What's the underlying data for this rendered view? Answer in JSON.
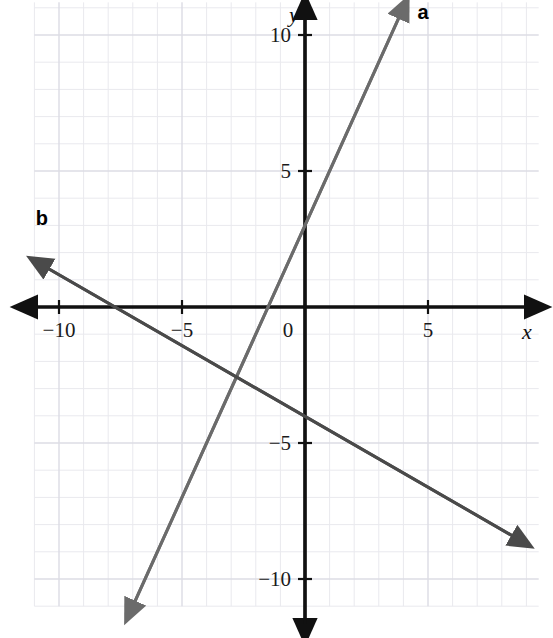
{
  "figure": {
    "background_color": "#ffffff",
    "grid_color": "#e9e9ee",
    "grid_major_color": "#dcdce4",
    "axis_color": "#111111"
  },
  "axes": {
    "x_name": "x",
    "y_name": "y",
    "origin_label": "0",
    "x_ticks": [
      {
        "value": -10,
        "label": "−10"
      },
      {
        "value": -5,
        "label": "−5"
      },
      {
        "value": 5,
        "label": "5"
      }
    ],
    "y_ticks": [
      {
        "value": 10,
        "label": "10"
      },
      {
        "value": 5,
        "label": "5"
      },
      {
        "value": -5,
        "label": "−5"
      },
      {
        "value": -10,
        "label": "−10"
      }
    ]
  },
  "chart_data": {
    "type": "line",
    "title": "",
    "xlabel": "x",
    "ylabel": "y",
    "xlim": [
      -11.0,
      9.5
    ],
    "ylim": [
      -11.0,
      11.2
    ],
    "grid": true,
    "grid_step": 1,
    "grid_major_step": 5,
    "legend": "inline-labels",
    "series": [
      {
        "name": "a",
        "label": "a",
        "color": "#6b6b6b",
        "slope": 2.0,
        "y_intercept": 3.0,
        "x_intercept": -1.5,
        "equation": "y = 2x + 3",
        "arrow_start": true,
        "arrow_end": true,
        "endpoints": [
          {
            "x": -7.0,
            "y": -11.0
          },
          {
            "x": 3.9,
            "y": 10.8
          }
        ],
        "label_position": {
          "x": 4.8,
          "y": 10.6
        }
      },
      {
        "name": "b",
        "label": "b",
        "color": "#4a4a4a",
        "slope": -0.52,
        "y_intercept": -4.0,
        "x_intercept": -7.7,
        "equation": "y = -0.52x - 4",
        "arrow_start": true,
        "arrow_end": true,
        "endpoints": [
          {
            "x": -10.6,
            "y": 1.5
          },
          {
            "x": 8.6,
            "y": -8.5
          }
        ],
        "label_position": {
          "x": -10.7,
          "y": 3.0
        }
      }
    ],
    "intersection": {
      "x": -4.3,
      "y": -2.3
    }
  }
}
